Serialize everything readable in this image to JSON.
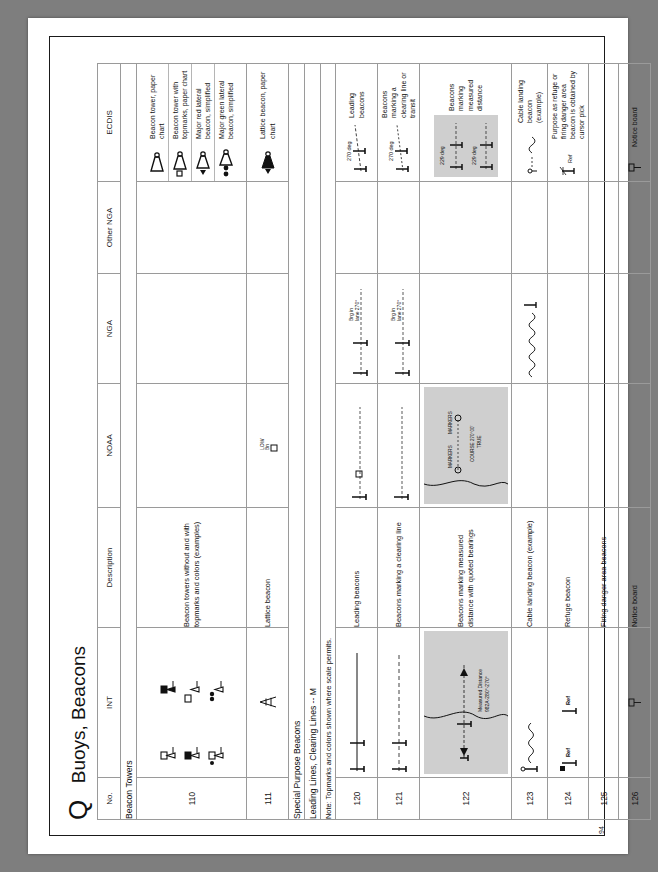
{
  "page": {
    "section_letter": "Q",
    "section_title": "Buoys, Beacons",
    "page_number": "94"
  },
  "table": {
    "headers": [
      "No.",
      "INT",
      "Description",
      "NOAA",
      "NGA",
      "Other NGA",
      "ECDIS"
    ],
    "group_headings": {
      "beacon_towers": "Beacon Towers",
      "special_purpose": "Special Purpose Beacons",
      "leading_lines": "Leading Lines, Clearing Lines -- M",
      "note_topmarks": "Note: Topmarks and colors shown where scale permits."
    },
    "rows": [
      {
        "no": "110",
        "description": "Beacon towers without and with topmarks and colors (examples)",
        "noaa": "",
        "nga": "",
        "other_nga": "",
        "ecdis_items": [
          "Beacon tower, paper chart",
          "Beacon tower with topmarks, paper chart",
          "Major red lateral beacon, simplified",
          "Major green lateral beacon, simplified"
        ]
      },
      {
        "no": "111",
        "description": "Lattice beacon",
        "noaa": "LOW\\nBn",
        "nga": "",
        "other_nga": "",
        "ecdis_items": [
          "Lattice beacon, paper chart"
        ]
      },
      {
        "no": "120",
        "description": "Leading beacons",
        "noaa": "",
        "nga": "Brg in\\nlane 270°",
        "other_nga": "",
        "ecdis_items": [
          "Leading beacons"
        ],
        "ecdis_note": "270 deg"
      },
      {
        "no": "121",
        "description": "Beacons marking a clearing line",
        "noaa": "",
        "nga": "Brg in\\nlane 270°",
        "other_nga": "",
        "ecdis_items": [
          "Beacons marking a clearing line or transit"
        ],
        "ecdis_note": "270 deg"
      },
      {
        "no": "122",
        "description": "Beacons marking measured distance with quoted bearings",
        "noaa": "MARKERS  MARKERS  COURSE 270°00' TRUE",
        "nga": "",
        "other_nga": "",
        "ecdis_items": [
          "Beacons marking measured distance"
        ],
        "ecdis_note": "229 deg"
      },
      {
        "no": "123",
        "description": "Cable landing beacon (example)",
        "noaa": "",
        "nga": "",
        "other_nga": "",
        "ecdis_items": [
          "Cable landing beacon (example)"
        ]
      },
      {
        "no": "124",
        "description": "Refuge beacon",
        "int_label": "Ref",
        "noaa": "",
        "nga": "",
        "other_nga": "",
        "ecdis_items": [
          "Purpose as refuge or firing danger area beacon is obtained by cursor pick"
        ]
      },
      {
        "no": "125",
        "description": "Firing danger area beacons",
        "noaa": "",
        "nga": "",
        "other_nga": "",
        "ecdis_items": [
          ""
        ]
      },
      {
        "no": "126",
        "description": "Notice board",
        "noaa": "",
        "nga": "",
        "other_nga": "",
        "ecdis_items": [
          "Notice board"
        ]
      }
    ],
    "int_labels": {
      "measured_distance": "Measured Distance",
      "measured_bearing": "982A-280°-270°",
      "refuge": "Ref"
    },
    "nga_labels": {
      "brg_line": "Brg in\nlane 270°",
      "markers": "MARKERS",
      "course": "COURSE 270°00' TRUE"
    },
    "ecdis_degree_labels": {
      "d270": "270 deg",
      "d229": "229 deg"
    }
  },
  "colors": {
    "ink": "#111111",
    "rule": "#9a9a9a",
    "panel_gray": "#cfcfcf",
    "paper": "#ffffff",
    "backdrop": "#7e7e7e"
  }
}
